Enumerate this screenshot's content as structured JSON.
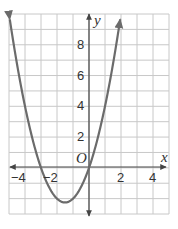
{
  "chart_data": {
    "type": "line",
    "title": "",
    "xlabel": "x",
    "ylabel": "y",
    "origin_label": "O",
    "xlim": [
      -5,
      5
    ],
    "ylim": [
      -3,
      10
    ],
    "grid": true,
    "grid_step": 1,
    "x_tick_labels": [
      "-4",
      "-2",
      "2",
      "4"
    ],
    "x_tick_values": [
      -4,
      -2,
      2,
      4
    ],
    "y_tick_labels": [
      "2",
      "4",
      "6",
      "8"
    ],
    "y_tick_values": [
      2,
      4,
      6,
      8
    ],
    "series": [
      {
        "name": "parabola",
        "equation": "y = x^2 + 3x",
        "x": [
          -5,
          -4.5,
          -4,
          -3.5,
          -3,
          -2.5,
          -2,
          -1.5,
          -1,
          -0.5,
          0,
          0.5,
          1,
          1.5,
          2
        ],
        "values": [
          10,
          6.75,
          4,
          1.75,
          0,
          -1.25,
          -2,
          -2.25,
          -2,
          -1.25,
          0,
          1.75,
          4,
          6.75,
          10
        ],
        "color": "#6b6b6b",
        "arrows_at_ends": true
      }
    ],
    "key_points": {
      "x_intercepts": [
        -3,
        0
      ],
      "vertex": [
        -1.5,
        -2.25
      ]
    }
  },
  "labels": {
    "x_axis": "x",
    "y_axis": "y",
    "origin": "O",
    "xt_m4": "−4",
    "xt_m2": "−2",
    "xt_2": "2",
    "xt_4": "4",
    "yt_2": "2",
    "yt_4": "4",
    "yt_6": "6",
    "yt_8": "8"
  },
  "colors": {
    "grid": "#c8c8c8",
    "axis": "#444444",
    "curve": "#6b6b6b",
    "text": "#333333"
  }
}
